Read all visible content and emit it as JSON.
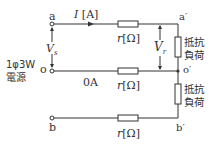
{
  "diagram": {
    "type": "single-phase three-wire circuit",
    "source_label_line1": "1φ3W",
    "source_label_line2": "電源",
    "terminals": {
      "a": "a",
      "o": "o",
      "b": "b",
      "a_prime": "a′",
      "o_prime": "o′",
      "b_prime": "b′"
    },
    "current_label": "I [A]",
    "current_var": "I",
    "current_unit": "[A]",
    "neutral_current": "0A",
    "source_voltage": "V",
    "source_voltage_sub": "s",
    "load_voltage": "V",
    "load_voltage_sub": "r",
    "resistor_label_var": "r",
    "resistor_label_unit": "[Ω]",
    "load_label_line1": "抵抗",
    "load_label_line2": "負荷",
    "colors": {
      "line": "#333333",
      "background": "#ffffff"
    }
  }
}
